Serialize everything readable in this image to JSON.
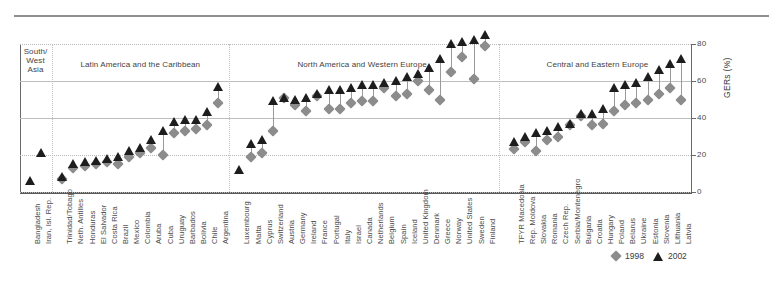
{
  "figure": {
    "y_axis_title": "GERs (%)",
    "y_ticks": [
      "0",
      "20",
      "40",
      "60",
      "80"
    ],
    "regions": [
      {
        "name": "South/\nWest\nAsia",
        "label": "South/ West Asia"
      },
      {
        "name": "Latin America and the Caribbean",
        "label": "Latin America and the Caribbean"
      },
      {
        "name": "North America and Western Europe",
        "label": "North America and Western Europe"
      },
      {
        "name": "Central and Eastern Europe",
        "label": "Central and Eastern Europe"
      }
    ],
    "legend": [
      {
        "marker": "diamond-marker",
        "label": "1998",
        "color": "#8c8c8c"
      },
      {
        "marker": "triangle-marker",
        "label": "2002",
        "color": "#1d1d1d"
      }
    ]
  },
  "chart_data": {
    "type": "scatter",
    "title": "",
    "subtitle": "",
    "xlabel": "",
    "ylabel": "GERs (%)",
    "ylim": [
      0,
      80
    ],
    "yticks": [
      0,
      20,
      40,
      60,
      80
    ],
    "grid": true,
    "legend_position": "bottom-right",
    "region_groups": [
      {
        "name": "South/West Asia",
        "start": 0,
        "end": 1
      },
      {
        "name": "Latin America and the Caribbean",
        "start": 2,
        "end": 16
      },
      {
        "name": "North America and Western Europe",
        "start": 17,
        "end": 39
      },
      {
        "name": "Central and Eastern Europe",
        "start": 40,
        "end": 55
      }
    ],
    "categories": [
      "Bangladesh",
      "Iran, Isl. Rep.",
      "Trinidad/Tobago",
      "Neth. Antilles",
      "Honduras",
      "El Salvador",
      "Costa Rica",
      "Brazil",
      "Mexico",
      "Colombia",
      "Aruba",
      "Cuba",
      "Uruguay",
      "Barbados",
      "Bolivia",
      "Chile",
      "Argentina",
      "Luxembourg",
      "Malta",
      "Cyprus",
      "Switzerland",
      "Austria",
      "Germany",
      "Ireland",
      "France",
      "Portugal",
      "Italy",
      "Israel",
      "Canada",
      "Netherlands",
      "Belgium",
      "Spain",
      "Iceland",
      "United Kingdom",
      "Denmark",
      "Greece",
      "Norway",
      "United States",
      "Sweden",
      "Finland",
      "TFYR Macedonia",
      "Rep. Moldova",
      "Slovakia",
      "Romania",
      "Czech Rep.",
      "Serbia/Montenegro",
      "Bulgaria",
      "Croatia",
      "Hungary",
      "Poland",
      "Belarus",
      "Ukraine",
      "Estonia",
      "Slovenia",
      "Lithuania",
      "Latvia"
    ],
    "series": [
      {
        "name": "1998",
        "marker": "diamond",
        "color": "#8c8c8c",
        "values": [
          null,
          null,
          7,
          13,
          14,
          15,
          16,
          15,
          19,
          21,
          24,
          20,
          32,
          33,
          34,
          36,
          48,
          null,
          19,
          21,
          33,
          51,
          47,
          44,
          52,
          45,
          45,
          48,
          49,
          49,
          56,
          52,
          53,
          60,
          55,
          50,
          65,
          73,
          61,
          79,
          23,
          27,
          22,
          28,
          30,
          36,
          41,
          36,
          37,
          44,
          47,
          48,
          50,
          53,
          56,
          50
        ]
      },
      {
        "name": "2002",
        "marker": "triangle",
        "color": "#1d1d1d",
        "values": [
          6,
          21,
          8,
          15,
          16,
          17,
          18,
          19,
          22,
          24,
          28,
          33,
          38,
          39,
          39,
          43,
          57,
          12,
          26,
          28,
          49,
          51,
          50,
          51,
          53,
          55,
          55,
          56,
          58,
          58,
          59,
          60,
          62,
          64,
          67,
          72,
          80,
          81,
          82,
          85,
          27,
          30,
          32,
          33,
          35,
          37,
          42,
          42,
          45,
          56,
          58,
          59,
          62,
          66,
          69,
          72
        ]
      }
    ]
  }
}
